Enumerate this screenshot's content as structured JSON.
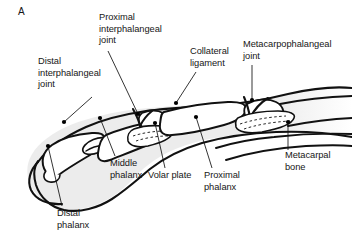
{
  "figure": {
    "panel_letter": "A",
    "background_color": "#ffffff",
    "line_color": "#111111",
    "soft_tissue_fill": "#ebebeb",
    "bone_fill": "#ffffff",
    "marker_color": "#000000"
  },
  "labels": [
    {
      "id": "distal-interphalangeal-joint",
      "text": "Distal\ninterphalangeal\njoint",
      "x": 38,
      "y": 58,
      "align": "left"
    },
    {
      "id": "proximal-interphalangeal-joint",
      "text": "Proximal\ninterphalangeal\njoint",
      "x": 99,
      "y": 14,
      "align": "left"
    },
    {
      "id": "collateral-ligament",
      "text": "Collateral\nligament",
      "x": 190,
      "y": 48,
      "align": "left"
    },
    {
      "id": "metacarpophalangeal-joint",
      "text": "Metacarpophalangeal\njoint",
      "x": 243,
      "y": 41,
      "align": "left"
    },
    {
      "id": "metacarpal-bone",
      "text": "Metacarpal\nbone",
      "x": 285,
      "y": 152,
      "align": "left"
    },
    {
      "id": "proximal-phalanx",
      "text": "Proximal\nphalanx",
      "x": 204,
      "y": 172,
      "align": "left"
    },
    {
      "id": "volar-plate",
      "text": "Volar plate",
      "x": 148,
      "y": 172,
      "align": "left"
    },
    {
      "id": "middle-phalanx",
      "text": "Middle\nphalanx",
      "x": 110,
      "y": 160,
      "align": "left"
    },
    {
      "id": "distal-phalanx",
      "text": "Distal\nphalanx",
      "x": 57,
      "y": 210,
      "align": "left"
    }
  ],
  "leaders": [
    {
      "id": "leader-distal-interphalangeal-joint",
      "from": [
        92,
        97
      ],
      "to": [
        64,
        122
      ],
      "dot": [
        64,
        122
      ]
    },
    {
      "id": "leader-proximal-interphalangeal-joint",
      "from": [
        108,
        51
      ],
      "to": [
        138,
        114
      ],
      "dot": [
        138,
        114
      ]
    },
    {
      "id": "leader-collateral-ligament",
      "from": [
        196,
        72
      ],
      "to": [
        176,
        103
      ],
      "dot": [
        176,
        103
      ]
    },
    {
      "id": "leader-metacarpophalangeal-joint",
      "from": [
        252,
        65
      ],
      "to": [
        252,
        100
      ],
      "dot": [
        252,
        100
      ]
    },
    {
      "id": "leader-metacarpal-bone",
      "from": [
        288,
        150
      ],
      "to": [
        288,
        122
      ],
      "dot": [
        288,
        122
      ]
    },
    {
      "id": "leader-proximal-phalanx",
      "from": [
        212,
        168
      ],
      "to": [
        196,
        117
      ],
      "dot": [
        196,
        117
      ]
    },
    {
      "id": "leader-volar-plate",
      "from": [
        165,
        168
      ],
      "to": [
        155,
        123
      ],
      "dot": [
        155,
        123
      ]
    },
    {
      "id": "leader-middle-phalanx",
      "from": [
        115,
        156
      ],
      "to": [
        100,
        118
      ],
      "dot": [
        100,
        118
      ]
    },
    {
      "id": "leader-distal-phalanx",
      "from": [
        62,
        206
      ],
      "to": [
        48,
        146
      ],
      "dot": [
        48,
        146
      ]
    }
  ]
}
